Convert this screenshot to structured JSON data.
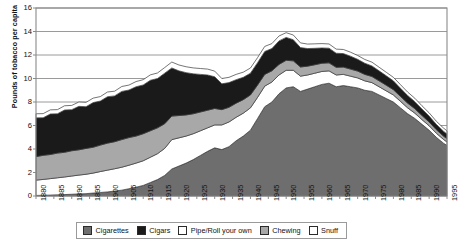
{
  "chart_data": {
    "type": "area",
    "stacked": true,
    "title": "",
    "xlabel": "",
    "ylabel": "Pounds of tobacco per capita",
    "ylim": [
      0,
      16
    ],
    "yticks": [
      0,
      2,
      4,
      6,
      8,
      10,
      12,
      14,
      16
    ],
    "xlim": [
      1880,
      1995
    ],
    "xticks": [
      1880,
      1885,
      1890,
      1895,
      1900,
      1905,
      1910,
      1915,
      1920,
      1925,
      1930,
      1935,
      1940,
      1945,
      1950,
      1955,
      1960,
      1965,
      1970,
      1975,
      1980,
      1985,
      1990,
      1995
    ],
    "grid": "horizontal",
    "legend_position": "bottom",
    "x": [
      1880,
      1882,
      1884,
      1886,
      1888,
      1890,
      1892,
      1894,
      1896,
      1898,
      1900,
      1902,
      1904,
      1906,
      1908,
      1910,
      1912,
      1914,
      1916,
      1918,
      1920,
      1922,
      1924,
      1926,
      1928,
      1930,
      1932,
      1934,
      1936,
      1938,
      1940,
      1942,
      1944,
      1946,
      1948,
      1950,
      1952,
      1954,
      1956,
      1958,
      1960,
      1962,
      1964,
      1966,
      1968,
      1970,
      1972,
      1974,
      1976,
      1978,
      1980,
      1982,
      1984,
      1986,
      1988,
      1990,
      1992,
      1994,
      1995
    ],
    "series": [
      {
        "name": "Cigarettes",
        "color": "#6e6e6e",
        "values": [
          0.05,
          0.06,
          0.08,
          0.1,
          0.12,
          0.15,
          0.18,
          0.2,
          0.25,
          0.3,
          0.35,
          0.42,
          0.5,
          0.62,
          0.75,
          0.9,
          1.15,
          1.4,
          1.75,
          2.3,
          2.55,
          2.8,
          3.1,
          3.45,
          3.8,
          4.1,
          3.95,
          4.2,
          4.7,
          5.1,
          5.6,
          6.6,
          7.6,
          8.0,
          8.7,
          9.2,
          9.3,
          8.9,
          9.1,
          9.3,
          9.5,
          9.6,
          9.3,
          9.4,
          9.3,
          9.2,
          9.0,
          8.9,
          8.6,
          8.3,
          8.0,
          7.5,
          7.0,
          6.6,
          6.1,
          5.6,
          5.0,
          4.5,
          4.3
        ]
      },
      {
        "name": "Pipe/Roll your own",
        "color": "#ffffff",
        "values": [
          1.3,
          1.35,
          1.4,
          1.45,
          1.5,
          1.55,
          1.6,
          1.65,
          1.7,
          1.78,
          1.85,
          1.9,
          1.95,
          2.0,
          2.05,
          2.1,
          2.15,
          2.2,
          2.3,
          2.5,
          2.4,
          2.3,
          2.2,
          2.1,
          2.0,
          1.95,
          2.1,
          2.1,
          2.0,
          1.95,
          1.9,
          1.8,
          1.75,
          1.7,
          1.6,
          1.5,
          1.4,
          1.3,
          1.2,
          1.15,
          1.1,
          1.05,
          1.0,
          0.95,
          0.9,
          0.85,
          0.8,
          0.75,
          0.7,
          0.65,
          0.6,
          0.55,
          0.5,
          0.45,
          0.4,
          0.38,
          0.35,
          0.32,
          0.3
        ]
      },
      {
        "name": "Chewing",
        "color": "#a8a8a8",
        "values": [
          2.0,
          2.05,
          2.05,
          2.1,
          2.1,
          2.15,
          2.15,
          2.2,
          2.2,
          2.25,
          2.3,
          2.3,
          2.35,
          2.35,
          2.3,
          2.3,
          2.25,
          2.2,
          2.1,
          2.0,
          1.9,
          1.8,
          1.7,
          1.6,
          1.5,
          1.4,
          1.3,
          1.25,
          1.2,
          1.15,
          1.1,
          1.05,
          1.0,
          0.95,
          0.9,
          0.85,
          0.8,
          0.78,
          0.75,
          0.72,
          0.7,
          0.68,
          0.65,
          0.62,
          0.6,
          0.58,
          0.55,
          0.52,
          0.5,
          0.48,
          0.45,
          0.42,
          0.4,
          0.38,
          0.35,
          0.32,
          0.3,
          0.28,
          0.27
        ]
      },
      {
        "name": "Cigars",
        "color": "#1a1a1a",
        "values": [
          3.3,
          3.2,
          3.45,
          3.35,
          3.6,
          3.5,
          3.7,
          3.55,
          3.8,
          3.75,
          3.95,
          3.9,
          4.1,
          4.05,
          4.2,
          4.15,
          4.3,
          4.2,
          4.3,
          4.1,
          3.8,
          3.6,
          3.4,
          3.2,
          3.0,
          2.7,
          2.2,
          2.1,
          2.0,
          1.9,
          1.85,
          1.9,
          1.95,
          1.9,
          2.0,
          1.95,
          1.8,
          1.65,
          1.5,
          1.4,
          1.3,
          1.25,
          1.2,
          1.15,
          1.1,
          1.0,
          0.95,
          0.9,
          0.85,
          0.8,
          0.75,
          0.7,
          0.65,
          0.6,
          0.55,
          0.5,
          0.45,
          0.42,
          0.4
        ]
      },
      {
        "name": "Snuff",
        "color": "#ffffff",
        "values": [
          0.35,
          0.35,
          0.35,
          0.35,
          0.36,
          0.36,
          0.37,
          0.37,
          0.38,
          0.38,
          0.4,
          0.4,
          0.42,
          0.42,
          0.44,
          0.45,
          0.46,
          0.47,
          0.48,
          0.5,
          0.5,
          0.5,
          0.5,
          0.5,
          0.5,
          0.48,
          0.45,
          0.45,
          0.45,
          0.44,
          0.44,
          0.43,
          0.43,
          0.42,
          0.42,
          0.4,
          0.4,
          0.4,
          0.38,
          0.38,
          0.37,
          0.36,
          0.35,
          0.35,
          0.34,
          0.33,
          0.32,
          0.32,
          0.31,
          0.3,
          0.3,
          0.3,
          0.29,
          0.29,
          0.28,
          0.28,
          0.27,
          0.27,
          0.27
        ]
      }
    ],
    "totals_note": "Peak total about 13.7 pounds per capita around 1950-1952; about 4.5 by 1995; about 7.0 in 1880"
  },
  "axis": {
    "y_title": "Pounds of tobacco per capita",
    "y_ticks": [
      "16",
      "14",
      "12",
      "10",
      "8",
      "6",
      "4",
      "2",
      "0"
    ],
    "x_ticks": [
      "1880",
      "1885",
      "1890",
      "1895",
      "1900",
      "1905",
      "1910",
      "1915",
      "1920",
      "1925",
      "1930",
      "1935",
      "1940",
      "1945",
      "1950",
      "1955",
      "1960",
      "1965",
      "1970",
      "1975",
      "1980",
      "1985",
      "1990",
      "1995"
    ]
  },
  "legend": {
    "items": [
      {
        "label": "Cigarettes",
        "color": "#6e6e6e"
      },
      {
        "label": "Cigars",
        "color": "#1a1a1a"
      },
      {
        "label": "Pipe/Roll your own",
        "color": "#ffffff"
      },
      {
        "label": "Chewing",
        "color": "#a8a8a8"
      },
      {
        "label": "Snuff",
        "color": "#ffffff"
      }
    ]
  },
  "colors": {
    "plot_border": "#8a8a8a",
    "grid": "#8f8f8f",
    "outline": "#3a3a3a",
    "text": "#111111",
    "background": "#ffffff"
  }
}
